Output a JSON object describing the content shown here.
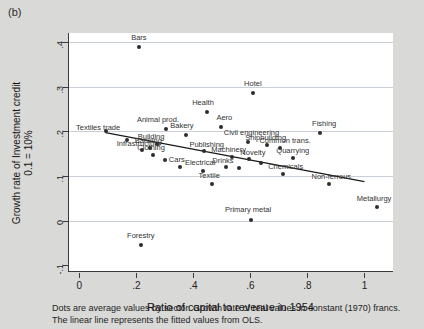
{
  "panel_label": "(b)",
  "xlabel": "Ratio of capital to revenue in 1954",
  "ylabel_line1": "Growth rate of Investment credit",
  "ylabel_line2": "0.1 = 10%",
  "caption_line1": "Dots are average values by sector. Growth rate of real values in constant (1970) francs.",
  "caption_line2": "The linear line represents the fitted values from OLS.",
  "chart_data": {
    "type": "scatter",
    "title": "",
    "xlabel": "Ratio of capital to revenue in 1954",
    "ylabel": "Growth rate of Investment credit  0.1 = 10%",
    "xlim": [
      -0.04,
      1.1
    ],
    "ylim": [
      -0.115,
      0.42
    ],
    "xticks": [
      0,
      0.2,
      0.4,
      0.6,
      0.8,
      1
    ],
    "xtick_labels": [
      "0",
      ".2",
      ".4",
      ".6",
      ".8",
      "1"
    ],
    "yticks": [
      -0.1,
      0,
      0.1,
      0.2,
      0.3,
      0.4
    ],
    "ytick_labels": [
      "-.1",
      "0",
      ".1",
      ".2",
      ".3",
      ".4"
    ],
    "grid": "horizontal",
    "legend": "none",
    "points": [
      {
        "label": "Bars",
        "x": 0.205,
        "y": 0.388,
        "lx": 0.205,
        "ly": 0.408
      },
      {
        "label": "Hotel",
        "x": 0.605,
        "y": 0.285,
        "lx": 0.605,
        "ly": 0.305
      },
      {
        "label": "Health",
        "x": 0.443,
        "y": 0.243,
        "lx": 0.43,
        "ly": 0.264
      },
      {
        "label": "Aero",
        "x": 0.492,
        "y": 0.21,
        "lx": 0.505,
        "ly": 0.23
      },
      {
        "label": "Animal prod.",
        "x": 0.3,
        "y": 0.205,
        "lx": 0.272,
        "ly": 0.226
      },
      {
        "label": "Textiles trade",
        "x": 0.09,
        "y": 0.2,
        "lx": 0.062,
        "ly": 0.207
      },
      {
        "label": "Bakery",
        "x": 0.37,
        "y": 0.192,
        "lx": 0.356,
        "ly": 0.212
      },
      {
        "label": "Fishing",
        "x": 0.84,
        "y": 0.196,
        "lx": 0.855,
        "ly": 0.216
      },
      {
        "label": "Civil engineering",
        "x": 0.588,
        "y": 0.176,
        "lx": 0.6,
        "ly": 0.196
      },
      {
        "label": "Building",
        "x": 0.27,
        "y": 0.172,
        "lx": 0.248,
        "ly": 0.188
      },
      {
        "label": "Banking",
        "x": 0.245,
        "y": 0.163,
        "lx": 0.238,
        "ly": 0.178
      },
      {
        "label": "Infrastructure",
        "x": 0.215,
        "y": 0.158,
        "lx": 0.205,
        "ly": 0.172
      },
      {
        "label": "Shipbuilding",
        "x": 0.655,
        "y": 0.17,
        "lx": 0.65,
        "ly": 0.186
      },
      {
        "label": "Common trans.",
        "x": 0.7,
        "y": 0.162,
        "lx": 0.718,
        "ly": 0.178
      },
      {
        "label": "Clothing",
        "x": 0.255,
        "y": 0.148,
        "lx": 0.248,
        "ly": 0.162
      },
      {
        "label": "Publishing",
        "x": 0.432,
        "y": 0.156,
        "lx": 0.443,
        "ly": 0.17
      },
      {
        "label": "Machinery",
        "x": 0.53,
        "y": 0.143,
        "lx": 0.52,
        "ly": 0.158
      },
      {
        "label": "Novelty",
        "x": 0.59,
        "y": 0.138,
        "lx": 0.605,
        "ly": 0.152
      },
      {
        "label": "Cars",
        "x": 0.35,
        "y": 0.12,
        "lx": 0.338,
        "ly": 0.136
      },
      {
        "label": "Electrical",
        "x": 0.43,
        "y": 0.112,
        "lx": 0.42,
        "ly": 0.128
      },
      {
        "label": "Drinks",
        "x": 0.51,
        "y": 0.12,
        "lx": 0.5,
        "ly": 0.134
      },
      {
        "label": "Quarrying",
        "x": 0.745,
        "y": 0.14,
        "lx": 0.745,
        "ly": 0.156
      },
      {
        "label": "Chemicals",
        "x": 0.712,
        "y": 0.104,
        "lx": 0.72,
        "ly": 0.12
      },
      {
        "label": "Non-ferrous",
        "x": 0.872,
        "y": 0.082,
        "lx": 0.88,
        "ly": 0.098
      },
      {
        "label": "Textile",
        "x": 0.46,
        "y": 0.082,
        "lx": 0.452,
        "ly": 0.1
      },
      {
        "label": "Metallurgy",
        "x": 1.04,
        "y": 0.03,
        "lx": 1.03,
        "ly": 0.048
      },
      {
        "label": "Primary metal",
        "x": 0.6,
        "y": 0.002,
        "lx": 0.588,
        "ly": 0.024
      },
      {
        "label": "Forestry",
        "x": 0.212,
        "y": -0.055,
        "lx": 0.212,
        "ly": -0.034
      },
      {
        "label": "",
        "x": 0.298,
        "y": 0.135,
        "lx": 0,
        "ly": 0
      },
      {
        "label": "",
        "x": 0.165,
        "y": 0.18,
        "lx": 0,
        "ly": 0
      },
      {
        "label": "",
        "x": 0.632,
        "y": 0.128,
        "lx": 0,
        "ly": 0
      },
      {
        "label": "",
        "x": 0.555,
        "y": 0.118,
        "lx": 0,
        "ly": 0
      }
    ],
    "fit_line": {
      "name": "OLS fitted values",
      "x_start": 0.088,
      "y_start": 0.196,
      "x_end": 1.0,
      "y_end": 0.086
    }
  }
}
